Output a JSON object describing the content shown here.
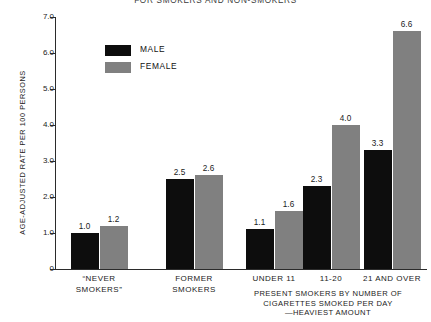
{
  "chart_data": {
    "type": "bar",
    "title": "FOR SMOKERS AND NON-SMOKERS",
    "ylabel": "AGE-ADJUSTED RATE PER 100 PERSONS",
    "xlabel": "",
    "caption": "PRESENT SMOKERS BY NUMBER OF\nCIGARETTES SMOKED PER DAY\n—HEAVIEST AMOUNT",
    "ylim": [
      0,
      7.0
    ],
    "yticks": [
      "0",
      "1.0",
      "2.0",
      "3.0",
      "4.0",
      "5.0",
      "6.0",
      "7.0"
    ],
    "ytick_values": [
      0,
      1.0,
      2.0,
      3.0,
      4.0,
      5.0,
      6.0,
      7.0
    ],
    "grid": false,
    "legend_position": "upper-left-inside",
    "categories": [
      "“NEVER\nSMOKERS”",
      "FORMER\nSMOKERS",
      "UNDER 11",
      "11-20",
      "21 AND OVER"
    ],
    "series": [
      {
        "name": "MALE",
        "color": "#0d0d0d",
        "values": [
          1.0,
          2.5,
          1.1,
          2.3,
          3.3
        ],
        "labels": [
          "1.0",
          "2.5",
          "1.1",
          "2.3",
          "3.3"
        ]
      },
      {
        "name": "FEMALE",
        "color": "#808080",
        "values": [
          1.2,
          2.6,
          1.6,
          4.0,
          6.6
        ],
        "labels": [
          "1.2",
          "2.6",
          "1.6",
          "4.0",
          "6.6"
        ]
      }
    ]
  },
  "legend": {
    "items": [
      {
        "label": "MALE",
        "color": "#0d0d0d"
      },
      {
        "label": "FEMALE",
        "color": "#808080"
      }
    ]
  }
}
